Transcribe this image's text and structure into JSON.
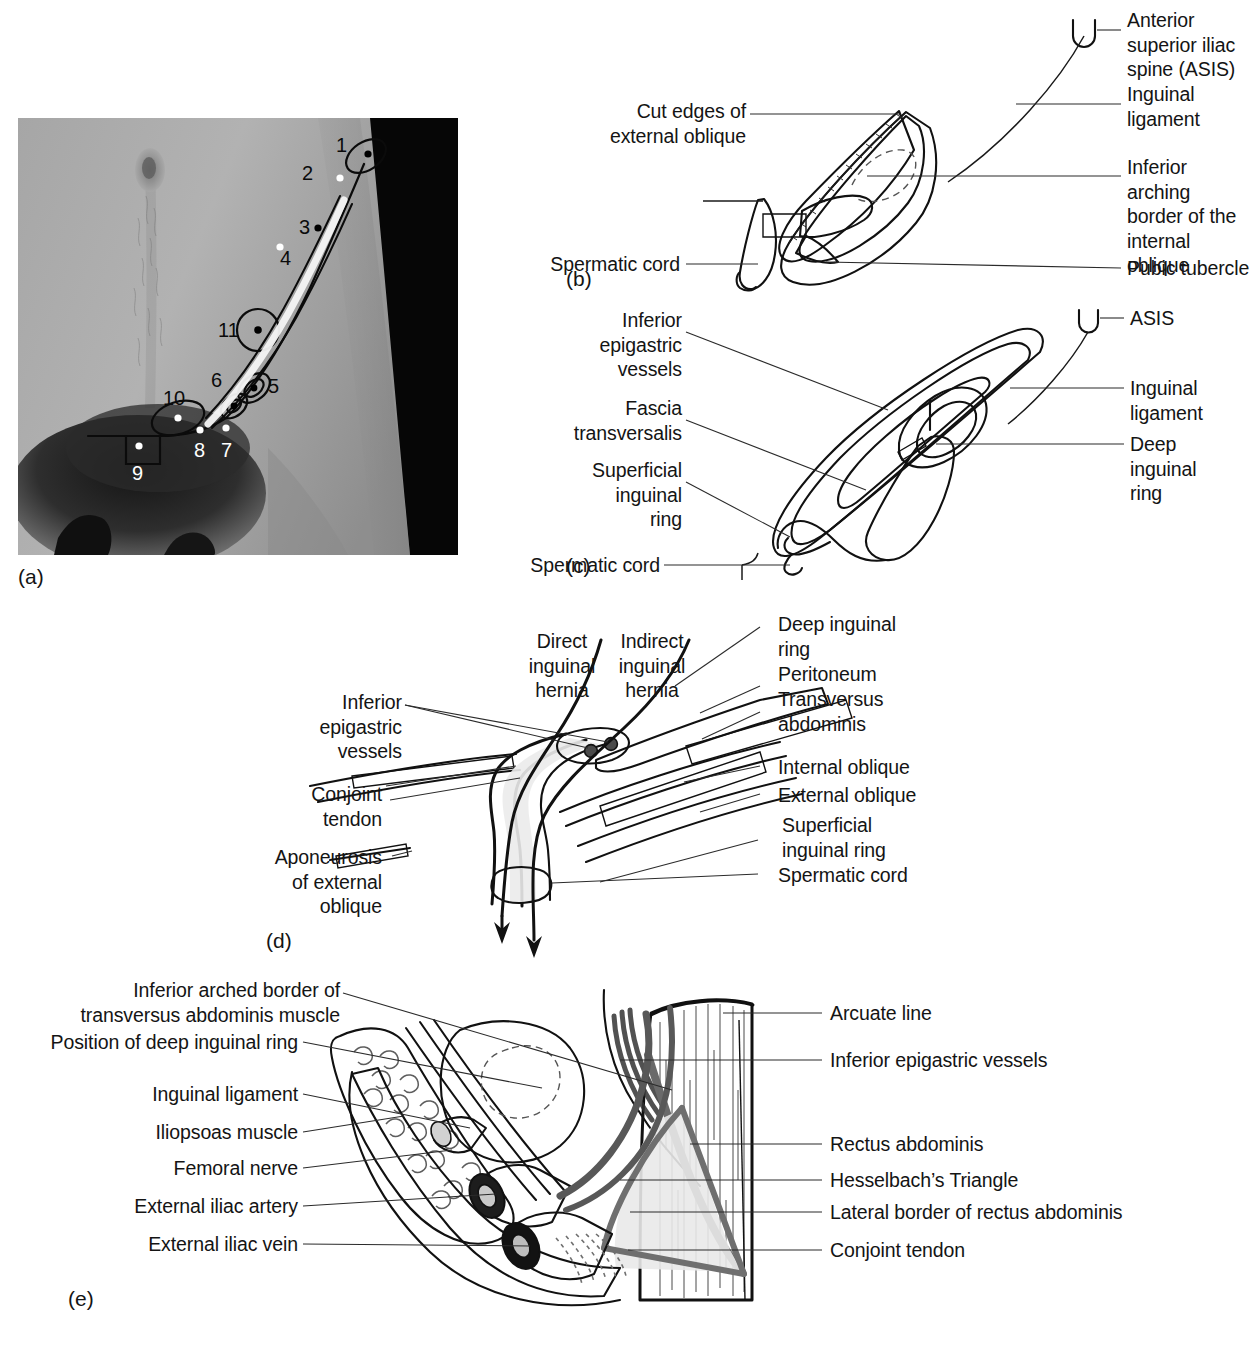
{
  "figure": {
    "panels": [
      "(a)",
      "(b)",
      "(c)",
      "(d)",
      "(e)"
    ]
  },
  "panel_a": {
    "id": "(a)",
    "type": "photograph",
    "description": "Surface anatomy photograph of the right inguinal region with numbered markers",
    "markers": [
      {
        "n": "1"
      },
      {
        "n": "2"
      },
      {
        "n": "3"
      },
      {
        "n": "4"
      },
      {
        "n": "5"
      },
      {
        "n": "6"
      },
      {
        "n": "7"
      },
      {
        "n": "8"
      },
      {
        "n": "9"
      },
      {
        "n": "10"
      },
      {
        "n": "11"
      }
    ]
  },
  "panel_b": {
    "id": "(b)",
    "labels_left": [
      {
        "key": "cut_edges",
        "text": "Cut edges of\nexternal oblique"
      },
      {
        "key": "spermatic_cord",
        "text": "Spermatic cord"
      }
    ],
    "labels_right": [
      {
        "key": "asis",
        "text": "Anterior\nsuperior iliac\nspine (ASIS)"
      },
      {
        "key": "inguinal_ligament",
        "text": "Inguinal\nligament"
      },
      {
        "key": "internal_oblique_border",
        "text": "Inferior arching\nborder of the\ninternal oblique"
      },
      {
        "key": "pubic_tubercle",
        "text": "Pubic tubercle"
      }
    ]
  },
  "panel_c": {
    "id": "(c)",
    "labels_left": [
      {
        "key": "inferior_epigastric_vessels",
        "text": "Inferior\nepigastric\nvessels"
      },
      {
        "key": "fascia_transversalis",
        "text": "Fascia\ntransversalis"
      },
      {
        "key": "superficial_inguinal_ring",
        "text": "Superficial\ninguinal\nring"
      },
      {
        "key": "spermatic_cord",
        "text": "Spermatic cord"
      }
    ],
    "labels_right": [
      {
        "key": "asis",
        "text": "ASIS"
      },
      {
        "key": "inguinal_ligament",
        "text": "Inguinal\nligament"
      },
      {
        "key": "deep_inguinal_ring",
        "text": "Deep\ninguinal\nring"
      }
    ]
  },
  "panel_d": {
    "id": "(d)",
    "labels_top": [
      {
        "key": "direct_hernia",
        "text": "Direct\ninguinal\nhernia"
      },
      {
        "key": "indirect_hernia",
        "text": "Indirect\ninguinal\nhernia"
      }
    ],
    "labels_left": [
      {
        "key": "inferior_epigastric_vessels",
        "text": "Inferior\nepigastric\nvessels"
      },
      {
        "key": "conjoint_tendon",
        "text": "Conjoint\ntendon"
      },
      {
        "key": "aponeurosis_external_oblique",
        "text": "Aponeurosis\nof external\noblique"
      }
    ],
    "labels_right": [
      {
        "key": "deep_inguinal_ring",
        "text": "Deep inguinal\nring"
      },
      {
        "key": "peritoneum",
        "text": "Peritoneum"
      },
      {
        "key": "transversus_abdominis",
        "text": "Transversus\nabdominis"
      },
      {
        "key": "internal_oblique",
        "text": "Internal oblique"
      },
      {
        "key": "external_oblique",
        "text": "External oblique"
      },
      {
        "key": "superficial_inguinal_ring",
        "text": "Superficial\ninguinal ring"
      },
      {
        "key": "spermatic_cord",
        "text": "Spermatic cord"
      }
    ]
  },
  "panel_e": {
    "id": "(e)",
    "labels_left": [
      {
        "key": "transversus_border",
        "text": "Inferior arched border of\ntransversus abdominis muscle"
      },
      {
        "key": "deep_ring_position",
        "text": "Position of deep inguinal ring"
      },
      {
        "key": "inguinal_ligament",
        "text": "Inguinal ligament"
      },
      {
        "key": "iliopsoas",
        "text": "Iliopsoas muscle"
      },
      {
        "key": "femoral_nerve",
        "text": "Femoral nerve"
      },
      {
        "key": "external_iliac_artery",
        "text": "External iliac artery"
      },
      {
        "key": "external_iliac_vein",
        "text": "External iliac vein"
      }
    ],
    "labels_right": [
      {
        "key": "arcuate_line",
        "text": "Arcuate line"
      },
      {
        "key": "inferior_epigastric_vessels",
        "text": "Inferior epigastric vessels"
      },
      {
        "key": "rectus_abdominis",
        "text": "Rectus abdominis"
      },
      {
        "key": "hesselbachs_triangle",
        "text": "Hesselbach’s Triangle"
      },
      {
        "key": "lateral_border_rectus",
        "text": "Lateral border of rectus abdominis"
      },
      {
        "key": "conjoint_tendon",
        "text": "Conjoint tendon"
      }
    ]
  },
  "colors": {
    "ink": "#141414",
    "leader": "#2b2b2b",
    "fill_light": "#e4e4e4",
    "fill_mid": "#c8c8c8",
    "fill_dark": "#9e9e9e",
    "fill_vessel": "#6e6e6e",
    "page_bg": "#ffffff"
  }
}
